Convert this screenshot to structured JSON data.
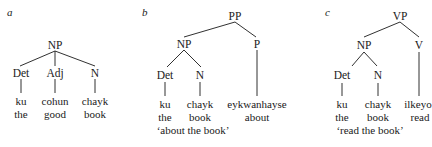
{
  "trees": [
    {
      "label": "a",
      "root": "NP",
      "children": [
        {
          "cat": "Det",
          "word": "ku",
          "gloss": "the"
        },
        {
          "cat": "Adj",
          "word": "cohun",
          "gloss": "good"
        },
        {
          "cat": "N",
          "word": "chayk",
          "gloss": "book"
        }
      ],
      "translation": ""
    },
    {
      "label": "b",
      "root": "PP",
      "np": "NP",
      "head": "P",
      "children": [
        {
          "cat": "Det",
          "word": "ku",
          "gloss": "the"
        },
        {
          "cat": "N",
          "word": "chayk",
          "gloss": "book"
        },
        {
          "cat": "P",
          "word": "eykwanhayse",
          "gloss": "about"
        }
      ],
      "translation": "‘about the book’"
    },
    {
      "label": "c",
      "root": "VP",
      "np": "NP",
      "head": "V",
      "children": [
        {
          "cat": "Det",
          "word": "ku",
          "gloss": "the"
        },
        {
          "cat": "N",
          "word": "chayk",
          "gloss": "book"
        },
        {
          "cat": "V",
          "word": "ilkeyo",
          "gloss": "read"
        }
      ],
      "translation": "‘read the book’"
    }
  ]
}
